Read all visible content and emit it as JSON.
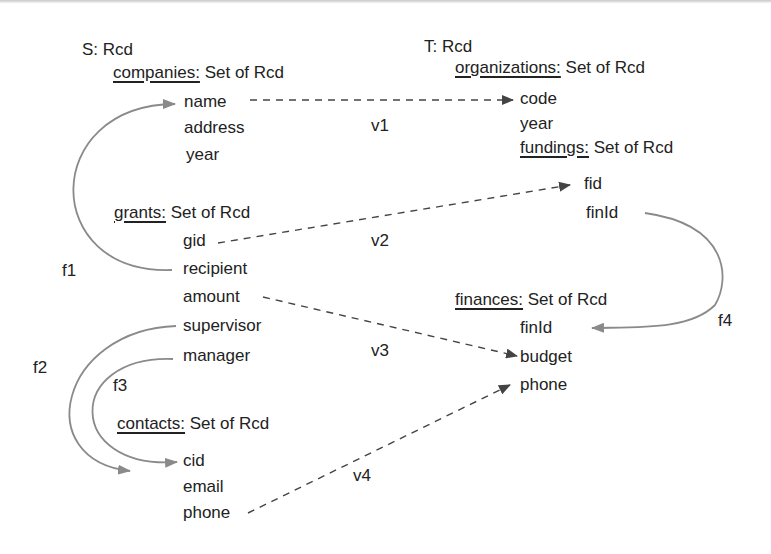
{
  "source": {
    "root": "S: Rcd",
    "companies": {
      "header": "companies:",
      "type": " Set of Rcd",
      "fields": [
        "name",
        "address",
        "year"
      ]
    },
    "grants": {
      "header": "grants:",
      "type": " Set of Rcd",
      "fields": [
        "gid",
        "recipient",
        "amount",
        "supervisor",
        "manager"
      ]
    },
    "contacts": {
      "header": "contacts:",
      "type": " Set of Rcd",
      "fields": [
        "cid",
        "email",
        "phone"
      ]
    }
  },
  "target": {
    "root": "T: Rcd",
    "organizations": {
      "header": "organizations:",
      "type": " Set of Rcd",
      "fields": [
        "code",
        "year"
      ]
    },
    "fundings": {
      "header": "fundings:",
      "type": " Set of Rcd",
      "fields": [
        "fid",
        "finId"
      ]
    },
    "finances": {
      "header": "finances:",
      "type": " Set of Rcd",
      "fields": [
        "finId",
        "budget",
        "phone"
      ]
    }
  },
  "correspondences": [
    {
      "label": "v1",
      "from": "companies.name",
      "to": "organizations.code",
      "style": "dashed"
    },
    {
      "label": "v2",
      "from": "grants.gid",
      "to": "fundings.fid",
      "style": "dashed"
    },
    {
      "label": "v3",
      "from": "grants.amount",
      "to": "finances.budget",
      "style": "dashed"
    },
    {
      "label": "v4",
      "from": "contacts.phone",
      "to": "finances.phone",
      "style": "dashed"
    }
  ],
  "foreign_keys": [
    {
      "label": "f1",
      "from": "grants.recipient",
      "to": "companies.name",
      "style": "solid"
    },
    {
      "label": "f2",
      "from": "grants.supervisor",
      "to": "contacts.cid",
      "style": "solid"
    },
    {
      "label": "f3",
      "from": "grants.manager",
      "to": "contacts.cid",
      "style": "solid"
    },
    {
      "label": "f4",
      "from": "fundings.finId",
      "to": "finances.finId",
      "style": "solid"
    }
  ],
  "colors": {
    "text": "#222222",
    "dashed_arrow": "#444444",
    "fk_arrow": "#8a8a8a"
  }
}
